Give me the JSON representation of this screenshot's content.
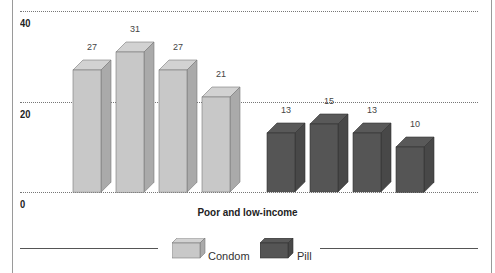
{
  "chart_data": {
    "type": "bar",
    "style": "3d-clustered",
    "title": "",
    "xlabel": "Poor and low-income",
    "ylabel": "",
    "ylim": [
      0,
      40
    ],
    "yticks": [
      "0",
      "20",
      "40"
    ],
    "grid": true,
    "legend_position": "bottom",
    "series": [
      {
        "name": "Condom",
        "color": "#c8c8c8",
        "values": [
          27,
          31,
          27,
          21
        ]
      },
      {
        "name": "Pill",
        "color": "#555555",
        "values": [
          13,
          15,
          13,
          10
        ]
      }
    ]
  },
  "legend": {
    "items": [
      {
        "label": "Condom",
        "color": "#c8c8c8"
      },
      {
        "label": "Pill",
        "color": "#555555"
      }
    ]
  }
}
